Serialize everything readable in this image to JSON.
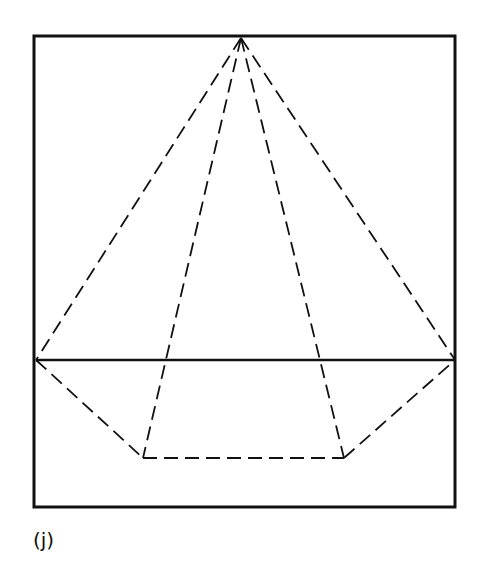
{
  "figure": {
    "label": "(j)",
    "frame": {
      "x": 34,
      "y": 36,
      "width": 421,
      "height": 471
    },
    "horizon": {
      "x1": 36,
      "y1": 360,
      "x2": 455,
      "y2": 360
    },
    "apex": {
      "x": 241,
      "y": 38
    },
    "base_points": [
      {
        "x": 36,
        "y": 360
      },
      {
        "x": 143,
        "y": 458
      },
      {
        "x": 344,
        "y": 458
      },
      {
        "x": 455,
        "y": 360
      }
    ],
    "line_color": "#111111"
  }
}
